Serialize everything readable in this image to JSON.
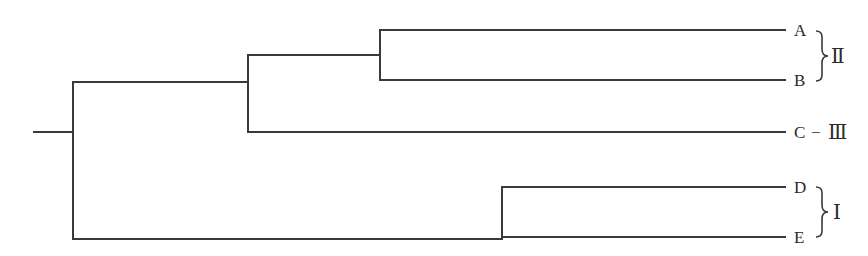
{
  "diagram": {
    "type": "dendrogram",
    "leaves": [
      {
        "id": "A",
        "label": "A"
      },
      {
        "id": "B",
        "label": "B"
      },
      {
        "id": "C",
        "label": "C"
      },
      {
        "id": "D",
        "label": "D"
      },
      {
        "id": "E",
        "label": "E"
      }
    ],
    "groups": [
      {
        "label": "Ⅱ",
        "members": [
          "A",
          "B"
        ]
      },
      {
        "label": "Ⅲ",
        "members": [
          "C"
        ],
        "connector": "−"
      },
      {
        "label": "Ⅰ",
        "members": [
          "D",
          "E"
        ]
      }
    ],
    "tree": "((((A,B),C),(D,E)))",
    "colors": {
      "line": "#3a3a3a",
      "text": "#2a2a2a",
      "background": "#ffffff"
    }
  }
}
